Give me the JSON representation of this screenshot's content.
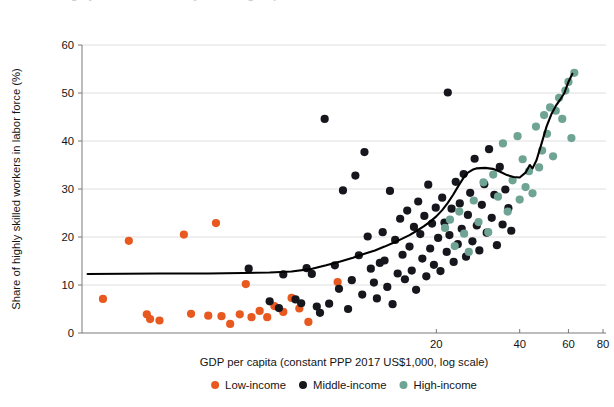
{
  "figure": {
    "clipped_title": "●  Share of highly skilled workers by income group"
  },
  "chart_data": {
    "type": "scatter",
    "title": "",
    "xlabel": "GDP per capita (constant PPP 2017 US$1,000, log scale)",
    "ylabel": "Share of highly skilled workers in labor force (%)",
    "x_scale": "log",
    "xlim": [
      1.05,
      82
    ],
    "ylim": [
      0,
      60
    ],
    "xticks": [
      20,
      40,
      60,
      80
    ],
    "xtick_labels": [
      "20",
      "40",
      "60",
      "80"
    ],
    "yticks": [
      0,
      10,
      20,
      30,
      40,
      50,
      60
    ],
    "ytick_labels": [
      "0",
      "10",
      "20",
      "30",
      "40",
      "50",
      "60"
    ],
    "grid": "horizontal",
    "legend_position": "below-axis",
    "legend": [
      {
        "name": "Low-income",
        "color": "#e8591f"
      },
      {
        "name": "Middle-income",
        "color": "#16161d"
      },
      {
        "name": "High-income",
        "color": "#6fa494"
      }
    ],
    "series": [
      {
        "name": "Low-income",
        "color": "#e8591f",
        "points": [
          [
            1.25,
            7.1
          ],
          [
            1.55,
            19.2
          ],
          [
            1.8,
            3.9
          ],
          [
            1.85,
            2.9
          ],
          [
            2.0,
            2.6
          ],
          [
            2.45,
            20.5
          ],
          [
            2.6,
            4.0
          ],
          [
            3.0,
            3.6
          ],
          [
            3.2,
            22.9
          ],
          [
            3.35,
            3.5
          ],
          [
            3.6,
            1.9
          ],
          [
            3.9,
            3.9
          ],
          [
            4.1,
            10.2
          ],
          [
            4.3,
            3.3
          ],
          [
            4.6,
            4.6
          ],
          [
            4.9,
            3.3
          ],
          [
            5.2,
            5.6
          ],
          [
            5.6,
            4.4
          ],
          [
            6.0,
            7.3
          ],
          [
            6.4,
            5.1
          ],
          [
            6.9,
            2.3
          ],
          [
            8.8,
            10.6
          ]
        ]
      },
      {
        "name": "Middle-income",
        "color": "#16161d",
        "points": [
          [
            4.2,
            13.4
          ],
          [
            5.0,
            6.6
          ],
          [
            5.4,
            5.2
          ],
          [
            5.6,
            12.2
          ],
          [
            6.2,
            7.0
          ],
          [
            6.5,
            6.2
          ],
          [
            6.8,
            13.5
          ],
          [
            7.1,
            12.3
          ],
          [
            7.4,
            5.5
          ],
          [
            7.6,
            4.2
          ],
          [
            7.9,
            44.6
          ],
          [
            8.2,
            6.1
          ],
          [
            8.6,
            14.1
          ],
          [
            8.9,
            9.2
          ],
          [
            9.2,
            29.7
          ],
          [
            9.6,
            5.0
          ],
          [
            9.9,
            11.0
          ],
          [
            10.2,
            32.8
          ],
          [
            10.5,
            16.2
          ],
          [
            10.8,
            8.0
          ],
          [
            11.0,
            37.7
          ],
          [
            11.3,
            20.1
          ],
          [
            11.6,
            13.4
          ],
          [
            11.9,
            10.5
          ],
          [
            12.2,
            7.2
          ],
          [
            12.5,
            14.6
          ],
          [
            12.8,
            21.0
          ],
          [
            13.0,
            15.1
          ],
          [
            13.3,
            9.6
          ],
          [
            13.6,
            29.6
          ],
          [
            13.9,
            6.0
          ],
          [
            14.2,
            19.4
          ],
          [
            14.5,
            12.4
          ],
          [
            14.8,
            23.8
          ],
          [
            15.1,
            16.3
          ],
          [
            15.4,
            11.2
          ],
          [
            15.7,
            25.5
          ],
          [
            16.0,
            18.0
          ],
          [
            16.3,
            13.0
          ],
          [
            16.6,
            22.1
          ],
          [
            16.9,
            9.0
          ],
          [
            17.2,
            27.4
          ],
          [
            17.5,
            20.6
          ],
          [
            17.8,
            15.5
          ],
          [
            18.1,
            24.4
          ],
          [
            18.4,
            11.8
          ],
          [
            18.7,
            30.9
          ],
          [
            19.0,
            17.6
          ],
          [
            19.3,
            22.8
          ],
          [
            19.6,
            14.2
          ],
          [
            19.9,
            26.1
          ],
          [
            20.3,
            19.8
          ],
          [
            20.7,
            12.9
          ],
          [
            21.0,
            28.2
          ],
          [
            21.4,
            23.0
          ],
          [
            21.8,
            16.9
          ],
          [
            22.0,
            50.1
          ],
          [
            22.3,
            20.4
          ],
          [
            22.7,
            25.9
          ],
          [
            23.1,
            14.8
          ],
          [
            23.5,
            31.5
          ],
          [
            23.9,
            18.5
          ],
          [
            24.3,
            27.0
          ],
          [
            24.7,
            21.7
          ],
          [
            25.1,
            33.1
          ],
          [
            25.6,
            15.9
          ],
          [
            26.0,
            24.6
          ],
          [
            26.5,
            29.2
          ],
          [
            27.0,
            19.1
          ],
          [
            27.5,
            36.3
          ],
          [
            28.0,
            22.4
          ],
          [
            28.6,
            17.2
          ],
          [
            29.2,
            26.7
          ],
          [
            29.8,
            31.0
          ],
          [
            30.4,
            20.9
          ],
          [
            31.0,
            38.3
          ],
          [
            31.7,
            24.0
          ],
          [
            32.4,
            28.8
          ],
          [
            33.1,
            18.3
          ],
          [
            33.9,
            34.6
          ],
          [
            34.7,
            22.6
          ],
          [
            35.5,
            29.9
          ],
          [
            36.4,
            26.0
          ],
          [
            37.3,
            21.3
          ]
        ]
      },
      {
        "name": "High-income",
        "color": "#6fa494",
        "points": [
          [
            21.5,
            21.9
          ],
          [
            22.4,
            23.6
          ],
          [
            23.3,
            18.1
          ],
          [
            24.2,
            25.3
          ],
          [
            25.2,
            20.7
          ],
          [
            26.2,
            16.9
          ],
          [
            27.3,
            27.6
          ],
          [
            28.4,
            23.1
          ],
          [
            29.6,
            31.4
          ],
          [
            30.8,
            21.0
          ],
          [
            32.1,
            33.0
          ],
          [
            33.4,
            28.4
          ],
          [
            34.8,
            39.5
          ],
          [
            36.2,
            25.3
          ],
          [
            37.7,
            31.8
          ],
          [
            39.3,
            41.0
          ],
          [
            40.0,
            27.8
          ],
          [
            41.0,
            36.2
          ],
          [
            42.0,
            30.4
          ],
          [
            43.2,
            33.7
          ],
          [
            44.5,
            29.1
          ],
          [
            45.8,
            43.0
          ],
          [
            47.0,
            34.5
          ],
          [
            48.2,
            38.0
          ],
          [
            49.0,
            45.4
          ],
          [
            50.2,
            41.5
          ],
          [
            51.5,
            47.0
          ],
          [
            52.8,
            36.8
          ],
          [
            54.0,
            46.3
          ],
          [
            55.5,
            49.0
          ],
          [
            57.0,
            44.6
          ],
          [
            58.5,
            50.5
          ],
          [
            60.0,
            52.3
          ],
          [
            61.5,
            40.6
          ],
          [
            63.0,
            54.2
          ]
        ]
      }
    ],
    "trend_line": {
      "name": "smoothed trend",
      "color": "#000000",
      "points": [
        [
          1.1,
          12.3
        ],
        [
          2.0,
          12.4
        ],
        [
          3.0,
          12.4
        ],
        [
          4.0,
          12.5
        ],
        [
          5.0,
          12.6
        ],
        [
          6.0,
          12.8
        ],
        [
          7.0,
          13.3
        ],
        [
          8.0,
          14.1
        ],
        [
          9.0,
          14.9
        ],
        [
          10.0,
          15.7
        ],
        [
          11.0,
          16.5
        ],
        [
          12.0,
          17.2
        ],
        [
          13.0,
          18.0
        ],
        [
          14.0,
          18.8
        ],
        [
          15.0,
          19.6
        ],
        [
          16.0,
          20.4
        ],
        [
          17.0,
          21.3
        ],
        [
          18.0,
          22.2
        ],
        [
          19.0,
          23.2
        ],
        [
          20.0,
          24.3
        ],
        [
          21.0,
          25.6
        ],
        [
          22.0,
          27.1
        ],
        [
          23.0,
          28.8
        ],
        [
          24.0,
          30.6
        ],
        [
          25.0,
          32.2
        ],
        [
          26.0,
          33.4
        ],
        [
          27.0,
          34.0
        ],
        [
          28.0,
          34.3
        ],
        [
          30.0,
          34.4
        ],
        [
          32.0,
          34.2
        ],
        [
          34.0,
          33.6
        ],
        [
          36.0,
          32.9
        ],
        [
          38.0,
          32.5
        ],
        [
          40.0,
          32.4
        ],
        [
          42.0,
          33.4
        ],
        [
          43.5,
          35.0
        ],
        [
          44.5,
          34.3
        ],
        [
          46.0,
          36.0
        ],
        [
          48.0,
          39.5
        ],
        [
          50.0,
          43.0
        ],
        [
          52.0,
          45.5
        ],
        [
          54.0,
          47.3
        ],
        [
          56.0,
          48.6
        ],
        [
          58.0,
          50.0
        ],
        [
          60.0,
          52.3
        ],
        [
          62.0,
          54.0
        ]
      ]
    }
  }
}
